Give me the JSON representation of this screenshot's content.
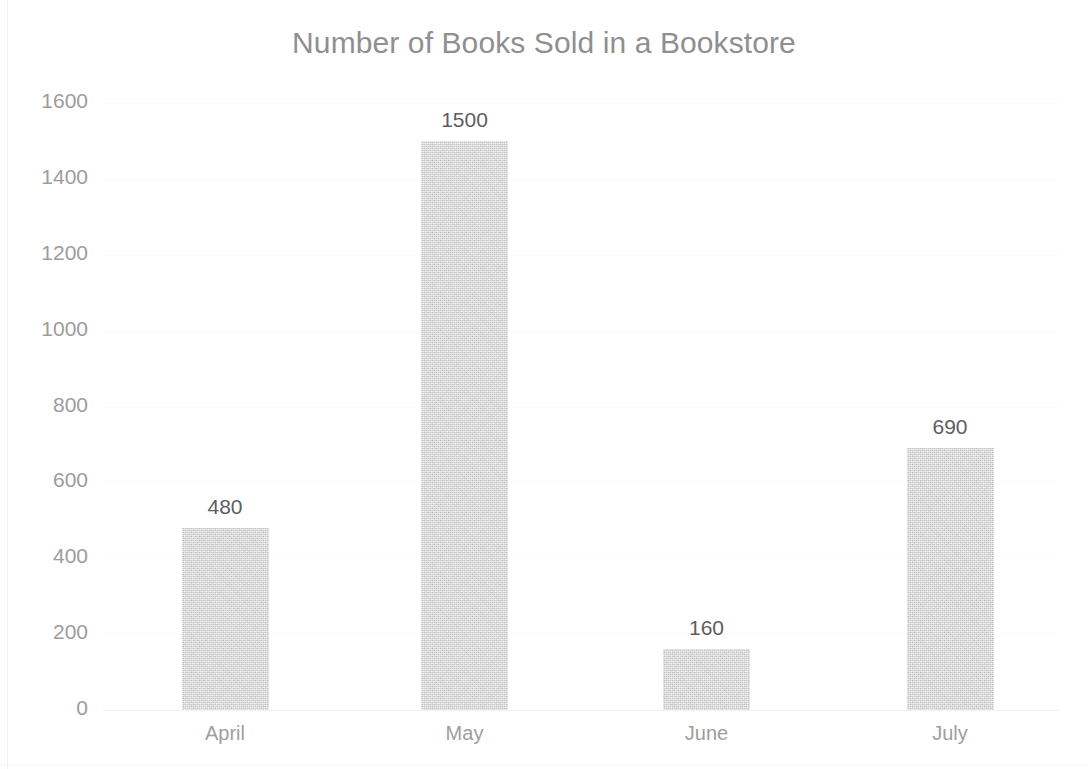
{
  "chart_data": {
    "type": "bar",
    "title": "Number of Books Sold in a Bookstore",
    "xlabel": "",
    "ylabel": "",
    "categories": [
      "April",
      "May",
      "June",
      "July"
    ],
    "values": [
      480,
      1500,
      160,
      690
    ],
    "data_labels": [
      "480",
      "1500",
      "160",
      "690"
    ],
    "ylim": [
      0,
      1600
    ],
    "ytick_step": 200,
    "ytick_labels": [
      "1600",
      "1400",
      "1200",
      "1000",
      "800",
      "600",
      "400",
      "200",
      "0"
    ],
    "ytick_values": [
      1600,
      1400,
      1200,
      1000,
      800,
      600,
      400,
      200,
      0
    ],
    "grid": true,
    "grid_axis": "y",
    "legend": false,
    "legend_position": "none",
    "series": [
      {
        "name": "Books Sold",
        "values": [
          480,
          1500,
          160,
          690
        ]
      }
    ]
  },
  "style": {
    "title_color": "#8f8f8f",
    "axis_label_color": "#9c9c9c",
    "category_label_color": "#9e9e9e",
    "data_label_color": "#5e5e5e",
    "bar_color": "#d2d2d2",
    "gridline_color": "#fbfbfb",
    "background_color": "#ffffff"
  }
}
